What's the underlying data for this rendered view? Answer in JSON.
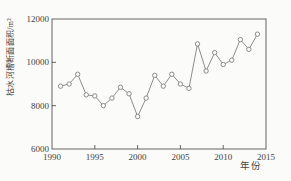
{
  "page": {
    "background_color": "#fbfbf9"
  },
  "chart_data": {
    "type": "line",
    "title": "",
    "xlabel": "年份",
    "ylabel": "枯水河槽断面面积/m²",
    "x": [
      1991,
      1992,
      1993,
      1994,
      1995,
      1996,
      1997,
      1998,
      1999,
      2000,
      2001,
      2002,
      2003,
      2004,
      2005,
      2006,
      2007,
      2008,
      2009,
      2010,
      2011,
      2012,
      2013,
      2014
    ],
    "values": [
      8900,
      9000,
      9450,
      8500,
      8450,
      8000,
      8350,
      8850,
      8550,
      7500,
      8350,
      9400,
      8900,
      9450,
      9000,
      8800,
      10850,
      9600,
      10450,
      9900,
      10100,
      11050,
      10600,
      11300
    ],
    "xlim": [
      1990,
      2015
    ],
    "ylim": [
      6000,
      12000
    ],
    "xticks": [
      1990,
      1995,
      2000,
      2005,
      2010,
      2015
    ],
    "yticks": [
      6000,
      8000,
      10000,
      12000
    ],
    "grid": false,
    "legend": null,
    "marker": "open-circle",
    "line_color": "#8c8c8c",
    "marker_fill": "#fbfbf9",
    "axis_color": "#55524e",
    "text_color": "#45423e"
  }
}
